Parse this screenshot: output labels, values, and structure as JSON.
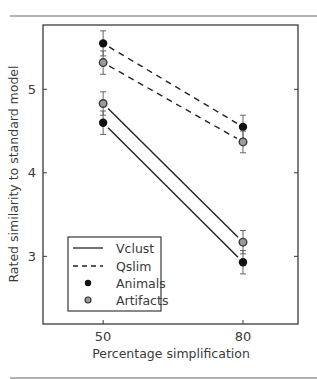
{
  "chart_data": {
    "type": "line",
    "title": "",
    "xlabel": "Percentage simplification",
    "ylabel": "Rated similarity to standard model",
    "x": [
      50,
      80
    ],
    "xticks": [
      "50",
      "80"
    ],
    "yticks": [
      "3",
      "4",
      "5"
    ],
    "xlim": [
      37.1,
      91.8
    ],
    "ylim": [
      2.19,
      5.77
    ],
    "grid": false,
    "legend_position": "lower left",
    "legend": [
      {
        "label": "Vclust",
        "style": "solid-line"
      },
      {
        "label": "Qslim",
        "style": "dashed-line"
      },
      {
        "label": "Animals",
        "style": "filled-black-circle"
      },
      {
        "label": "Artifacts",
        "style": "gray-circle"
      }
    ],
    "series": [
      {
        "name": "Qslim - Animals",
        "model": "Qslim",
        "category": "Animals",
        "line": "dashed",
        "marker": "black",
        "values": [
          5.55,
          4.55
        ],
        "error": [
          0.15,
          0.14
        ]
      },
      {
        "name": "Qslim - Artifacts",
        "model": "Qslim",
        "category": "Artifacts",
        "line": "dashed",
        "marker": "gray",
        "values": [
          5.32,
          4.37
        ],
        "error": [
          0.14,
          0.13
        ]
      },
      {
        "name": "Vclust - Artifacts",
        "model": "Vclust",
        "category": "Artifacts",
        "line": "solid",
        "marker": "gray",
        "values": [
          4.83,
          3.17
        ],
        "error": [
          0.14,
          0.14
        ]
      },
      {
        "name": "Vclust - Animals",
        "model": "Vclust",
        "category": "Animals",
        "line": "solid",
        "marker": "black",
        "values": [
          4.6,
          2.93
        ],
        "error": [
          0.14,
          0.14
        ]
      }
    ],
    "colors": {
      "axis": "#3a3a3a",
      "animals": "#111111",
      "artifacts": "#9a9a9a",
      "artifacts_edge": "#3a3a3a",
      "rule": "#555555"
    }
  }
}
